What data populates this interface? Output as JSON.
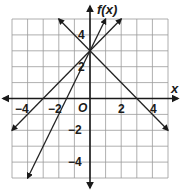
{
  "chart_data": {
    "type": "line",
    "title": "",
    "xlabel": "x",
    "ylabel": "f(x)",
    "origin_label": "O",
    "xlim": [
      -5,
      5
    ],
    "ylim": [
      -5,
      5
    ],
    "grid": true,
    "x_tick_labels": [
      "-4",
      "-2",
      "2",
      "4"
    ],
    "y_tick_labels": [
      "4",
      "2",
      "-2",
      "-4"
    ],
    "series": [
      {
        "name": "line-1",
        "equation": "f(x) = -x + 3",
        "points": [
          [
            -2,
            5
          ],
          [
            0,
            3
          ],
          [
            3,
            0
          ],
          [
            5,
            -2
          ]
        ]
      },
      {
        "name": "line-2",
        "equation": "f(x) = x + 3",
        "points": [
          [
            -5,
            -2
          ],
          [
            -3,
            0
          ],
          [
            0,
            3
          ],
          [
            2,
            5
          ]
        ]
      },
      {
        "name": "line-3",
        "equation": "f(x) = 2x + 3",
        "points": [
          [
            -4,
            -5
          ],
          [
            -1.5,
            0
          ],
          [
            0,
            3
          ],
          [
            1,
            5
          ]
        ]
      }
    ]
  },
  "labels": {
    "x_axis": "x",
    "y_axis": "f(x)",
    "origin": "O",
    "x_neg4": "−4",
    "x_neg2": "−2",
    "x_pos2": "2",
    "x_pos4": "4",
    "y_pos4": "4",
    "y_pos2": "2",
    "y_neg2": "−2",
    "y_neg4": "−4"
  },
  "colors": {
    "grid": "#9a9a9a",
    "axis": "#1a1a1a",
    "line": "#222222"
  }
}
